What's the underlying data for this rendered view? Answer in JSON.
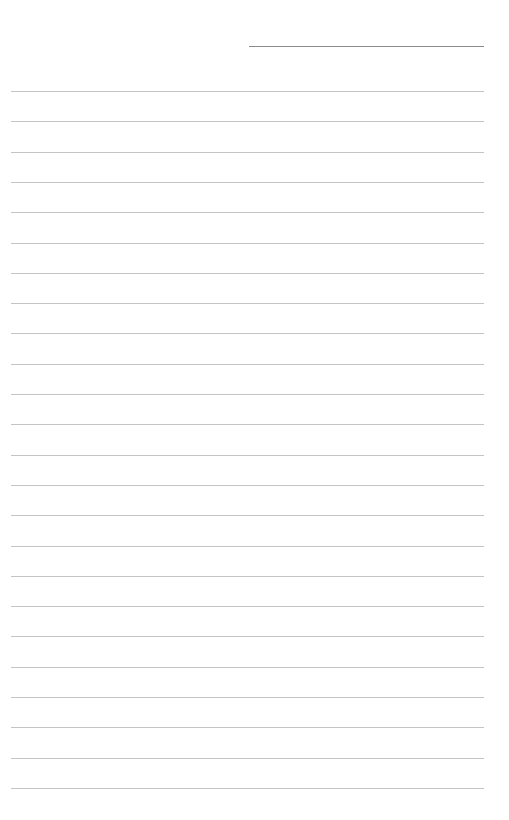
{
  "page": {
    "type": "lined-paper",
    "background_color": "#ffffff",
    "header_line": {
      "y": 46,
      "x_start": 249,
      "x_end": 484,
      "color": "#8a8a8a"
    },
    "ruled_lines": {
      "count": 24,
      "first_y": 91,
      "spacing": 30.3,
      "x_start": 11,
      "x_end": 484,
      "color": "#c4c4c4"
    }
  }
}
